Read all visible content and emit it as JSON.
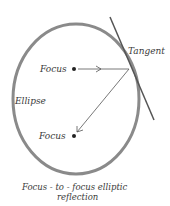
{
  "diagram": {
    "labels": {
      "tangent": "Tangent",
      "focus_top": "Focus",
      "focus_bottom": "Focus",
      "ellipse": "Ellipse"
    },
    "caption": {
      "line1": "Focus - to - focus elliptic",
      "line2": "reflection"
    },
    "colors": {
      "ellipse_stroke": "#7a7a7a",
      "line": "#4a4a4a",
      "text": "#3a3a3a",
      "background": "#ffffff"
    }
  }
}
